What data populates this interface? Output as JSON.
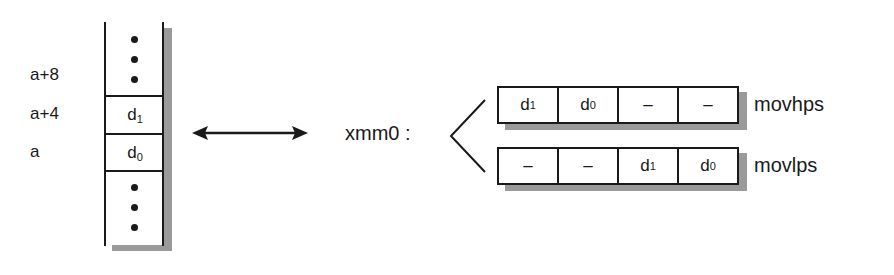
{
  "memory": {
    "addresses": [
      "a+8",
      "a+4",
      "a"
    ],
    "cells": [
      {
        "base": "d",
        "sub": "1"
      },
      {
        "base": "d",
        "sub": "0"
      }
    ],
    "ellipsis_top": "⋮",
    "ellipsis_bottom": "⋮"
  },
  "connector": {
    "type": "double-arrow"
  },
  "register": {
    "name": "xmm0 :",
    "rows": [
      {
        "instruction": "movhps",
        "cells": [
          {
            "base": "d",
            "sub": "1"
          },
          {
            "base": "d",
            "sub": "0"
          },
          {
            "base": "–",
            "sub": ""
          },
          {
            "base": "–",
            "sub": ""
          }
        ]
      },
      {
        "instruction": "movlps",
        "cells": [
          {
            "base": "–",
            "sub": ""
          },
          {
            "base": "–",
            "sub": ""
          },
          {
            "base": "d",
            "sub": "1"
          },
          {
            "base": "d",
            "sub": "0"
          }
        ]
      }
    ]
  },
  "colors": {
    "ink": "#1a1a1a",
    "shadow": "#9a9a9a",
    "background": "#ffffff"
  }
}
